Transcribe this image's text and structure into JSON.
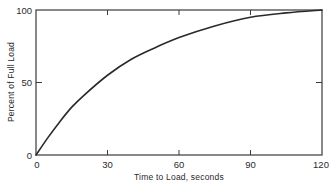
{
  "chart_data": {
    "type": "line",
    "title": "",
    "xlabel": "Time to Load, seconds",
    "ylabel": "Percent of Full Load",
    "xlim": [
      0,
      120
    ],
    "ylim": [
      0,
      100
    ],
    "xticks": [
      0,
      30,
      60,
      90,
      120
    ],
    "yticks": [
      0,
      50,
      100
    ],
    "grid": false,
    "legend": null,
    "series": [
      {
        "name": "Load curve",
        "x": [
          0,
          5,
          10,
          15,
          20,
          30,
          40,
          50,
          60,
          75,
          90,
          105,
          120
        ],
        "y": [
          0,
          12,
          23,
          33,
          41,
          55,
          66,
          74,
          81,
          89,
          95,
          98,
          100
        ]
      }
    ]
  },
  "labels": {
    "x_ticks": [
      "0",
      "30",
      "60",
      "90",
      "120"
    ],
    "y_ticks": [
      "0",
      "50",
      "100"
    ],
    "x_axis_title": "Time to Load, seconds",
    "y_axis_title": "Percent of Full Load"
  },
  "colors": {
    "line": "#2a2a2a",
    "frame": "#3a3a3a"
  }
}
